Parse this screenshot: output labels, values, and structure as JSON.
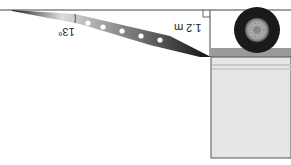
{
  "diagram": {
    "orientation": "rotated 180 degrees",
    "angle_label": "13°",
    "height_label": "1.2 m",
    "right_angle_marker": true,
    "colors": {
      "ramp_dark": "#111111",
      "ramp_light": "#e8e8e8",
      "truck_body": "#e6e6e6",
      "truck_edge": "#555555",
      "bumper": "#9a9a9a",
      "tire": "#1a1a1a",
      "hub": "#9c9c9c"
    }
  }
}
